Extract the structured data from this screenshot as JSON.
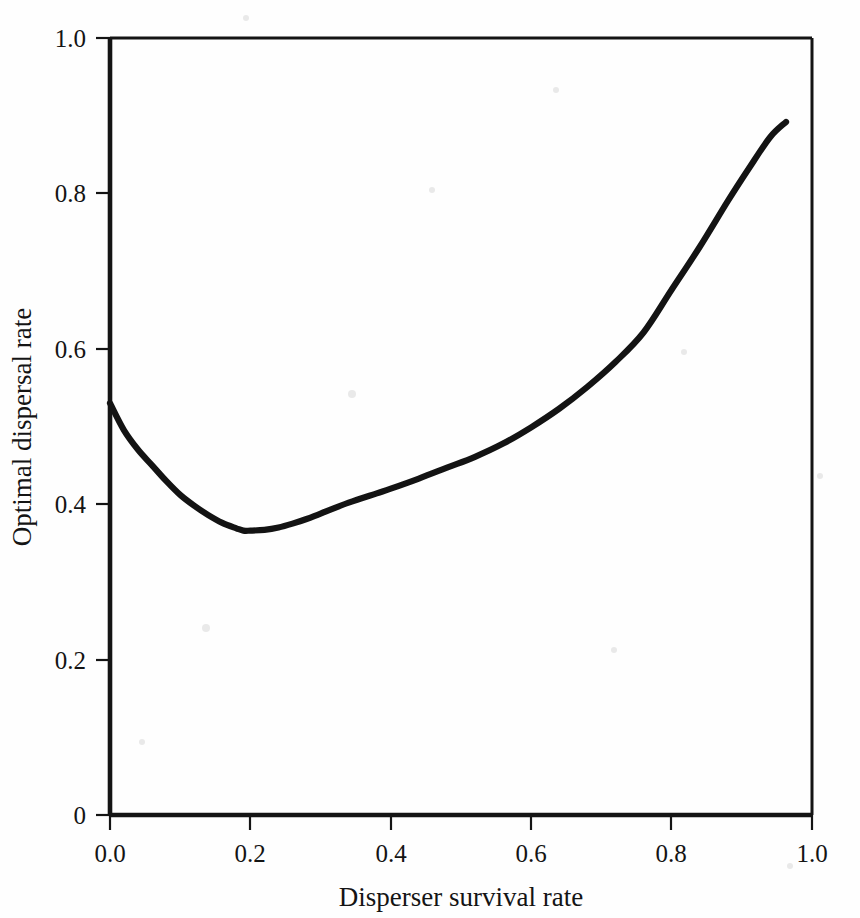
{
  "chart_data": {
    "type": "line",
    "title": "",
    "subtitle": "",
    "xlabel": "Disperser survival rate",
    "ylabel": "Optimal dispersal rate",
    "xlim": [
      0.0,
      1.0
    ],
    "ylim": [
      0.0,
      1.0
    ],
    "grid": false,
    "legend": "none",
    "x_ticks": [
      "0.0",
      "0.2",
      "0.4",
      "0.6",
      "0.8",
      "1.0"
    ],
    "x_tick_values": [
      0.0,
      0.2,
      0.4,
      0.6,
      0.8,
      1.0
    ],
    "y_ticks": [
      "0",
      "0.2",
      "0.4",
      "0.6",
      "0.8",
      "1.0"
    ],
    "y_tick_values": [
      0.0,
      0.2,
      0.4,
      0.6,
      0.8,
      1.0
    ],
    "series": [
      {
        "name": "Optimal dispersal rate",
        "color": "#131313",
        "x": [
          0.0,
          0.02,
          0.04,
          0.06,
          0.08,
          0.1,
          0.12,
          0.14,
          0.16,
          0.18,
          0.19,
          0.2,
          0.22,
          0.24,
          0.26,
          0.28,
          0.3,
          0.34,
          0.38,
          0.4,
          0.44,
          0.48,
          0.52,
          0.56,
          0.6,
          0.64,
          0.68,
          0.72,
          0.76,
          0.8,
          0.84,
          0.88,
          0.91,
          0.94,
          0.963
        ],
        "y": [
          0.53,
          0.495,
          0.47,
          0.45,
          0.43,
          0.412,
          0.398,
          0.386,
          0.376,
          0.369,
          0.366,
          0.366,
          0.367,
          0.37,
          0.375,
          0.381,
          0.388,
          0.402,
          0.414,
          0.42,
          0.433,
          0.447,
          0.461,
          0.478,
          0.499,
          0.523,
          0.551,
          0.583,
          0.621,
          0.676,
          0.731,
          0.79,
          0.832,
          0.872,
          0.892
        ]
      }
    ],
    "annotations": {
      "minimum_point": {
        "x": 0.19,
        "y": 0.366
      },
      "start_point": {
        "x": 0.0,
        "y": 0.53
      },
      "end_point": {
        "x": 0.963,
        "y": 0.892
      }
    },
    "axis_color": "#141414",
    "background_color": "#fefefe"
  },
  "figure": {
    "name": "optimal-dispersal-vs-survival-plot"
  }
}
